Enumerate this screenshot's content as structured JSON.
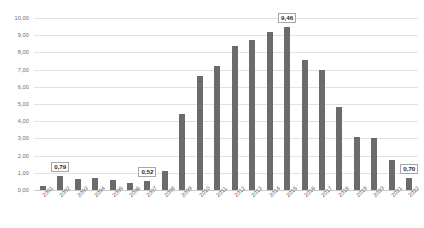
{
  "chart_data": {
    "type": "bar",
    "title": "",
    "xlabel": "",
    "ylabel": "",
    "grid": true,
    "legend": "none",
    "ylim": [
      0,
      10
    ],
    "decimal_separator": ",",
    "y_ticks": [
      "0,00",
      "1,00",
      "2,00",
      "3,00",
      "4,00",
      "5,00",
      "6,00",
      "7,00",
      "8,00",
      "9,00",
      "10,00"
    ],
    "y_tick_values": [
      0,
      1,
      2,
      3,
      4,
      5,
      6,
      7,
      8,
      9,
      10
    ],
    "categories": [
      "2001",
      "2002",
      "2003",
      "2004",
      "2005",
      "2006",
      "2007",
      "2008",
      "2009",
      "2010",
      "2011",
      "2012",
      "2013",
      "2014",
      "2015",
      "2016",
      "2017",
      "2018",
      "2019",
      "2020",
      "2021",
      "2022"
    ],
    "values": [
      0.25,
      0.79,
      0.62,
      0.7,
      0.6,
      0.38,
      0.52,
      1.1,
      4.4,
      6.6,
      7.2,
      8.35,
      8.7,
      9.2,
      9.46,
      7.55,
      6.95,
      4.8,
      3.1,
      3.05,
      1.75,
      0.7
    ],
    "series_color": "#6b6b6b",
    "gridline_color": "#e2e2e2",
    "axis_color": "#c9c9c9",
    "labels": [
      {
        "category": "2002",
        "text": "0,79",
        "value": 0.79
      },
      {
        "category": "2007",
        "text": "0,52",
        "value": 0.52
      },
      {
        "category": "2015",
        "text": "9,46",
        "value": 9.46
      },
      {
        "category": "2022",
        "text": "0,70",
        "value": 0.7
      }
    ]
  }
}
